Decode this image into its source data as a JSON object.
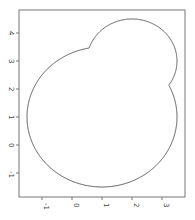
{
  "chart_data": {
    "type": "line",
    "title": "",
    "xlabel": "",
    "ylabel": "",
    "xlim": [
      -1.7,
      3.7
    ],
    "ylim": [
      -1.75,
      4.8
    ],
    "grid": false,
    "legend": null,
    "xticks": [
      "-1",
      "0",
      "1",
      "2",
      "3"
    ],
    "yticks": [
      "-1",
      "0",
      "1",
      "2",
      "3",
      "4"
    ],
    "shapes": [
      {
        "name": "union-of-circles",
        "circles": [
          {
            "cx": 1,
            "cy": 1,
            "r": 2.5
          },
          {
            "cx": 2,
            "cy": 3,
            "r": 1.5
          }
        ],
        "intersections": [
          [
            0.6,
            3.5
          ],
          [
            3.2,
            2.1
          ]
        ]
      }
    ],
    "line_color": "#555555"
  }
}
